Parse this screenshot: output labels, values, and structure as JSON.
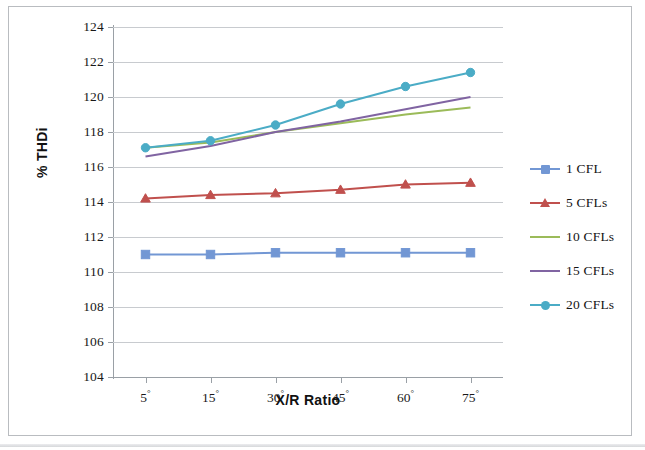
{
  "axis": {
    "x_title": "X/R Ratio",
    "y_title": "% THDi"
  },
  "chart_data": {
    "type": "line",
    "title": "",
    "xlabel": "X/R Ratio",
    "ylabel": "% THDi",
    "categories": [
      "5°",
      "15°",
      "30°",
      "45°",
      "60°",
      "75°"
    ],
    "ylim": [
      104,
      124
    ],
    "ytick_step": 2,
    "yticks": [
      104,
      106,
      108,
      110,
      112,
      114,
      116,
      118,
      120,
      122,
      124
    ],
    "grid": "horizontal",
    "legend_position": "right",
    "series": [
      {
        "name": "1 CFL",
        "color": "#7297d4",
        "marker": "square",
        "values": [
          111.0,
          111.0,
          111.1,
          111.1,
          111.1,
          111.1
        ]
      },
      {
        "name": "5 CFLs",
        "color": "#c0504d",
        "marker": "triangle",
        "values": [
          114.2,
          114.4,
          114.5,
          114.7,
          115.0,
          115.1
        ]
      },
      {
        "name": "10 CFLs",
        "color": "#9bbb59",
        "marker": "none",
        "values": [
          117.1,
          117.4,
          118.0,
          118.5,
          119.0,
          119.4
        ]
      },
      {
        "name": "15 CFLs",
        "color": "#8064a2",
        "marker": "none",
        "values": [
          116.6,
          117.2,
          118.0,
          118.6,
          119.3,
          120.0
        ]
      },
      {
        "name": "20 CFLs",
        "color": "#4bacc6",
        "marker": "circle",
        "values": [
          117.1,
          117.5,
          118.4,
          119.6,
          120.6,
          121.4
        ]
      }
    ]
  }
}
